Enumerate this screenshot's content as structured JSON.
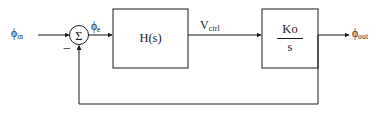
{
  "diagram": {
    "type": "control-block-diagram",
    "background_color": "#ffffff",
    "line_color": "#1a1a1a",
    "text_color": "#1a1a1a",
    "signals": {
      "input": {
        "symbol": "ϕ",
        "subscript": "in"
      },
      "error": {
        "symbol": "ϕ",
        "subscript": "e"
      },
      "control": {
        "symbol": "V",
        "subscript": "ctrl"
      },
      "output": {
        "symbol": "ϕ",
        "subscript": "out"
      }
    },
    "summing_junction": {
      "symbol": "Σ",
      "feedback_sign": "−"
    },
    "blocks": [
      {
        "id": "filter",
        "label": "H(s)"
      },
      {
        "id": "vco",
        "numerator": "K",
        "numerator_subscript": "o",
        "denominator": "s"
      }
    ]
  }
}
